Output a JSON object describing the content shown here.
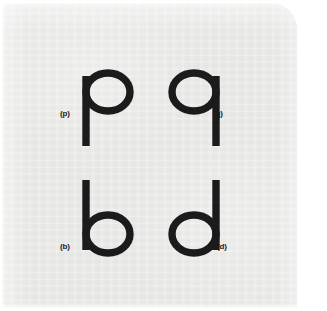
{
  "figure": {
    "kind": "letterform-comparison-figure",
    "background_color": "#e9e9e7",
    "page_color": "#ffffff",
    "glyph_color": "#1b1b1b",
    "label_color": "#1b1b1b",
    "rows": [
      {
        "row_name": "top-row",
        "cells": [
          {
            "glyph": "p",
            "label": "(p)",
            "label_side": "left"
          },
          {
            "glyph": "q",
            "label": "(q)",
            "label_side": "right"
          }
        ]
      },
      {
        "row_name": "bottom-row",
        "cells": [
          {
            "glyph": "b",
            "label": "(b)",
            "label_side": "left"
          },
          {
            "glyph": "d",
            "label": "(d)",
            "label_side": "right"
          }
        ]
      }
    ],
    "glyphs": {
      "p": {
        "letter": "p",
        "label": "(p)"
      },
      "q": {
        "letter": "q",
        "label": "(q)"
      },
      "b": {
        "letter": "b",
        "label": "(b)"
      },
      "d": {
        "letter": "d",
        "label": "(d)"
      }
    }
  }
}
